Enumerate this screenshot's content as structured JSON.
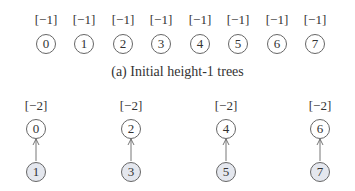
{
  "figure": {
    "panel_a": {
      "caption": "(a) Initial height-1 trees",
      "nodes": [
        {
          "id": "0",
          "label": "[−1]"
        },
        {
          "id": "1",
          "label": "[−1]"
        },
        {
          "id": "2",
          "label": "[−1]"
        },
        {
          "id": "3",
          "label": "[−1]"
        },
        {
          "id": "4",
          "label": "[−1]"
        },
        {
          "id": "5",
          "label": "[−1]"
        },
        {
          "id": "6",
          "label": "[−1]"
        },
        {
          "id": "7",
          "label": "[−1]"
        }
      ]
    },
    "panel_b": {
      "trees": [
        {
          "root": "0",
          "root_label": "[−2]",
          "child": "1"
        },
        {
          "root": "2",
          "root_label": "[−2]",
          "child": "3"
        },
        {
          "root": "4",
          "root_label": "[−2]",
          "child": "5"
        },
        {
          "root": "6",
          "root_label": "[−2]",
          "child": "7"
        }
      ]
    },
    "colors": {
      "stroke": "#666666",
      "shaded_fill": "#e4e7ee",
      "text": "#333333"
    }
  }
}
